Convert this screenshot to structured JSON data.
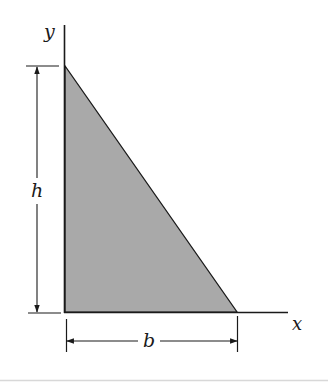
{
  "figure": {
    "fill_color": "#a9a9a9",
    "line_color": "#1a1a1a",
    "axes": {
      "x_label": "x",
      "y_label": "y"
    },
    "dimensions": {
      "height_label": "h",
      "base_label": "b"
    }
  }
}
